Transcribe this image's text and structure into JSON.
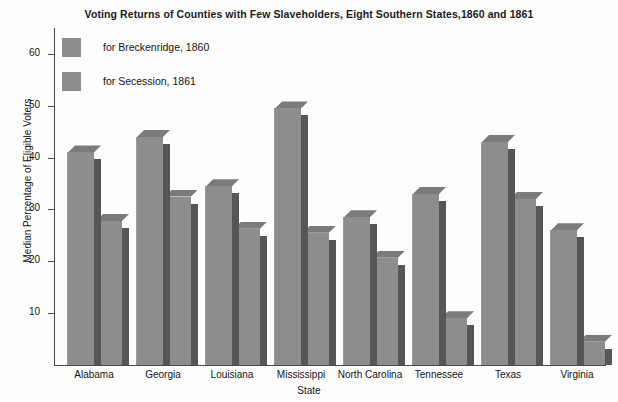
{
  "chart_data": {
    "type": "bar",
    "title": "Voting Returns of Counties with Few Slaveholders, Eight Southern States,1860 and 1861",
    "xlabel": "State",
    "ylabel": "Median Percentage of Eligible Voters",
    "categories": [
      "Alabama",
      "Georgia",
      "Louisiana",
      "Mississippi",
      "North Carolina",
      "Tennessee",
      "Texas",
      "Virginia"
    ],
    "series": [
      {
        "name": "for Breckenridge, 1860",
        "values": [
          41.0,
          44.0,
          34.5,
          49.5,
          28.5,
          33.0,
          43.0,
          26.0
        ],
        "color": "#8d8d8d"
      },
      {
        "name": "for Secession, 1861",
        "values": [
          27.8,
          32.5,
          26.3,
          25.5,
          20.7,
          9.0,
          32.0,
          4.5
        ],
        "color": "#8d8d8d"
      }
    ],
    "ylim": [
      0,
      65
    ],
    "yticks": [
      10,
      20,
      30,
      40,
      50,
      60
    ],
    "ytick_labels": [
      "10",
      "20",
      "30",
      "40",
      "50",
      "60"
    ],
    "grid": false,
    "legend_position": "top-left",
    "bar_style": "3d-extruded",
    "colors": {
      "bar_face": "#8d8d8d",
      "bar_side": "#565656",
      "bar_top": "#7b7b7b",
      "axis": "#4a4a4a",
      "background": "#fdfdfd",
      "text": "#141414"
    }
  }
}
